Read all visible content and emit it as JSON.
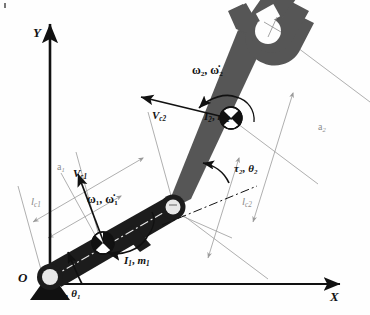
{
  "figure": {
    "type": "kinematic-diagram"
  },
  "axes": {
    "y_label": "Y",
    "x_label": "X",
    "origin_label": "O",
    "x_axis_name": "horizontal-axis",
    "y_axis_name": "vertical-axis"
  },
  "link1": {
    "inertia_mass_label": "I",
    "inertia_sub": "1",
    "mass_label": "m",
    "mass_sub": "1",
    "combined_label": "I₁, m₁",
    "angular_velocity_label": "ω₁, ω̇₁",
    "omega_base": "ω",
    "omega_dot_base": "ω̇",
    "torque_angle_label": "τ₁, θ₁",
    "torque_base": "τ",
    "theta_base": "θ",
    "velocity_label": "V",
    "velocity_sub": "c1",
    "length_label": "a",
    "length_sub": "1",
    "com_length_label": "l",
    "com_length_sub": "c1",
    "color": "#1c1c1c"
  },
  "link2": {
    "inertia_mass_label": "I₂, m₂",
    "inertia_label": "I",
    "inertia_sub": "2",
    "mass_label": "m",
    "mass_sub": "2",
    "angular_velocity_label": "ω₂, ω̇₂",
    "torque_angle_label": "τ₂, θ₂",
    "velocity_label": "V",
    "velocity_sub": "c2",
    "length_label": "a",
    "length_sub": "2",
    "com_length_label": "l",
    "com_length_sub": "c2",
    "color": "#565656"
  },
  "annotations": {
    "center_of_mass_symbol": "quartered-circle",
    "joint_symbol": "pin-joint-circle",
    "ground_symbol": "fixed-base-triangle",
    "gripper_symbol": "two-finger-gripper",
    "tool_center_point": "cross-mark"
  },
  "colors": {
    "link1_fill": "#1c1c1c",
    "link2_fill": "#565656",
    "joint_fill": "#e8e8e8",
    "dimension_line": "#9a9a9a",
    "axis_stroke": "#111111",
    "arrow_stroke": "#111111",
    "background": "#fefefe"
  }
}
